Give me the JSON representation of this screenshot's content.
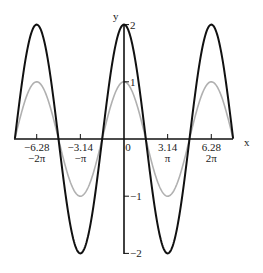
{
  "chart_data": {
    "type": "line",
    "title": "",
    "xlabel": "x",
    "ylabel": "y",
    "xlim": [
      -7.85,
      7.85
    ],
    "ylim": [
      -2,
      2
    ],
    "grid": false,
    "legend": null,
    "x_ticks": [
      {
        "value": -6.28,
        "label": "-6.28",
        "sublabel": "-2π"
      },
      {
        "value": -3.14,
        "label": "-3.14",
        "sublabel": "-π"
      },
      {
        "value": 0,
        "label": "0",
        "sublabel": ""
      },
      {
        "value": 3.14,
        "label": "3.14",
        "sublabel": "π"
      },
      {
        "value": 6.28,
        "label": "6.28",
        "sublabel": "2π"
      }
    ],
    "y_ticks": [
      {
        "value": 2,
        "label": "2"
      },
      {
        "value": 1,
        "label": "1"
      },
      {
        "value": -1,
        "label": "−1"
      },
      {
        "value": -2,
        "label": "−2"
      }
    ],
    "series": [
      {
        "name": "y = 2cos(x)",
        "function": "2cos(x)",
        "amplitude": 2,
        "color": "#111111",
        "width": 2
      },
      {
        "name": "y = cos(x)",
        "function": "cos(x)",
        "amplitude": 1,
        "color": "#b0b0b0",
        "width": 1.6
      }
    ]
  },
  "labels": {
    "x_axis": "x",
    "y_axis": "y"
  }
}
